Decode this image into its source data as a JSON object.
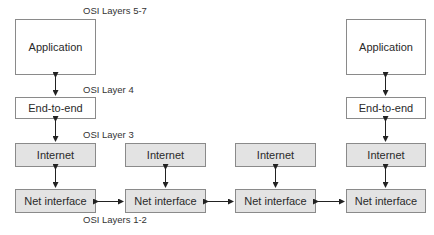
{
  "diagram": {
    "labels": {
      "layers_5_7": "OSI Layers 5-7",
      "layer_4": "OSI Layer 4",
      "layer_3": "OSI Layer 3",
      "layers_1_2": "OSI Layers 1-2"
    },
    "host_left": {
      "application": "Application",
      "end_to_end": "End-to-end",
      "internet": "Internet",
      "net_interface": "Net interface"
    },
    "router_1": {
      "internet": "Internet",
      "net_interface": "Net interface"
    },
    "router_2": {
      "internet": "Internet",
      "net_interface": "Net interface"
    },
    "host_right": {
      "application": "Application",
      "end_to_end": "End-to-end",
      "internet": "Internet",
      "net_interface": "Net interface"
    },
    "colors": {
      "upper_box_fill": "#ffffff",
      "lower_box_fill": "#e3e3e3",
      "border": "#8a8a8a",
      "arrow": "#222222"
    }
  }
}
